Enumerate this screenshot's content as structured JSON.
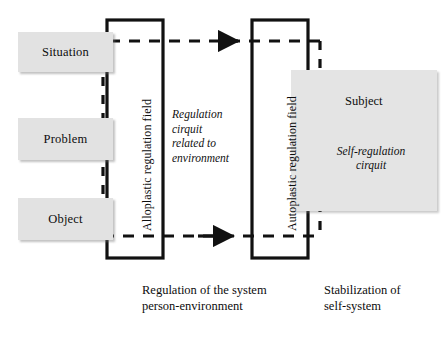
{
  "diagram": {
    "entities": [
      {
        "id": "situation",
        "label": "Situation",
        "x": 18,
        "y": 32,
        "w": 95,
        "h": 40
      },
      {
        "id": "problem",
        "label": "Problem",
        "x": 18,
        "y": 118,
        "w": 95,
        "h": 42
      },
      {
        "id": "object",
        "label": "Object",
        "x": 18,
        "y": 198,
        "w": 95,
        "h": 42
      }
    ],
    "fields": {
      "alloplastic": "Alloplastic regulation field",
      "autoplastic": "Autoplastic regulation field"
    },
    "environment_circuit": "Regulation\ncirquit\nrelated to\nenvironment",
    "subject": {
      "title": "Subject",
      "circuit": "Self-regulation\ncirquit"
    },
    "captions": {
      "left": "Regulation of the system\nperson-environment",
      "right": "Stabilization of\nself-system"
    },
    "colors": {
      "box_fill": "#e2e2e2",
      "subject_fill": "#e4e4e4",
      "stroke": "#111111",
      "background": "#ffffff"
    }
  }
}
